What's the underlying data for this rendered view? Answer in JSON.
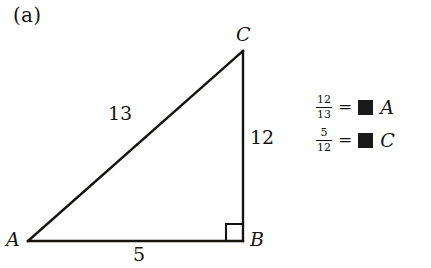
{
  "figure": {
    "panel_label": "(a)",
    "triangle": {
      "vertices": [
        {
          "name": "A",
          "label": "A",
          "x": 28,
          "y": 241
        },
        {
          "name": "B",
          "label": "B",
          "x": 243,
          "y": 241
        },
        {
          "name": "C",
          "label": "C",
          "x": 243,
          "y": 51
        }
      ],
      "sides": [
        {
          "name": "hypotenuse",
          "label": "13",
          "from": "A",
          "to": "C"
        },
        {
          "name": "vertical-leg",
          "label": "12",
          "from": "C",
          "to": "B"
        },
        {
          "name": "base",
          "label": "5",
          "from": "A",
          "to": "B"
        }
      ],
      "right_angle_at": "B",
      "stroke_color": "#141310"
    },
    "legend": {
      "equations": [
        {
          "numerator": "12",
          "denominator": "13",
          "equals": "=",
          "value_redacted": true,
          "vertex": "A"
        },
        {
          "numerator": "5",
          "denominator": "12",
          "equals": "=",
          "value_redacted": true,
          "vertex": "C"
        }
      ],
      "redaction_color": "#1a1a1a"
    },
    "background_color": "#ffffff"
  }
}
